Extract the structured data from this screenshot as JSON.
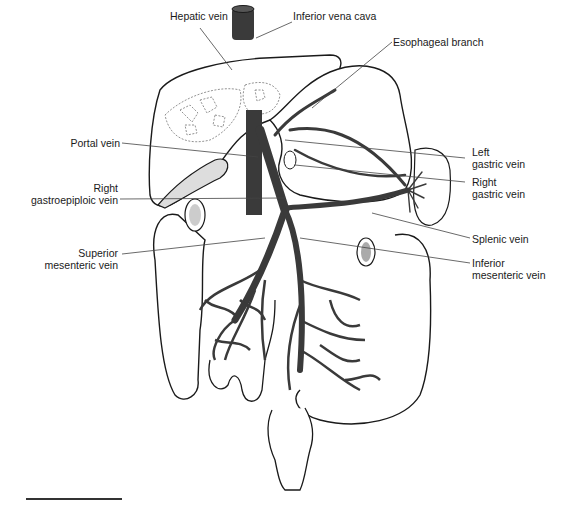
{
  "figure": {
    "colors": {
      "vein": "#3a3a3a",
      "outline": "#1a1a1a",
      "leader": "#444444",
      "background": "#ffffff"
    }
  },
  "labels": {
    "hepatic_vein": "Hepatic vein",
    "inferior_vena_cava": "Inferior vena cava",
    "esophageal_branch": "Esophageal branch",
    "portal_vein": "Portal vein",
    "left_gastric_vein": [
      "Left",
      "gastric vein"
    ],
    "right_gastroepiploic_vein": [
      "Right",
      "gastroepiploic vein"
    ],
    "right_gastric_vein": [
      "Right",
      "gastric vein"
    ],
    "splenic_vein": "Splenic vein",
    "superior_mesenteric_vein": [
      "Superior",
      "mesenteric vein"
    ],
    "inferior_mesenteric_vein": [
      "Inferior",
      "mesenteric vein"
    ]
  }
}
